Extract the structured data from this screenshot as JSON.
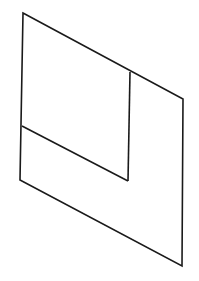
{
  "diagram": {
    "type": "line-drawing",
    "stroke_color": "#1a1a1a",
    "background_color": "#ffffff",
    "outer_shape": {
      "points": [
        [
          23,
          13
        ],
        [
          183,
          99
        ],
        [
          182,
          266
        ],
        [
          20,
          180
        ]
      ]
    },
    "inner_lines": [
      {
        "name": "inner-vertical",
        "from": [
          130,
          72
        ],
        "to": [
          128,
          181
        ]
      },
      {
        "name": "inner-slant",
        "from": [
          22,
          126
        ],
        "to": [
          128,
          181
        ]
      }
    ]
  }
}
